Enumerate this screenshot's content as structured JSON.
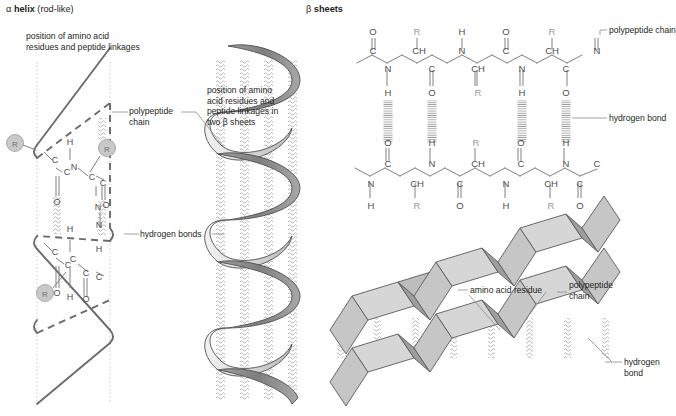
{
  "figure": {
    "kind": "protein-secondary-structure-diagram",
    "panels": [
      "alpha-helix",
      "beta-sheets"
    ]
  },
  "colors": {
    "ink": "#231f20",
    "atom_text": "#4d4d4d",
    "r_group_text": "#808080",
    "bond_line": "#808080",
    "leader": "#808080",
    "guide_dotted": "#b3b3b3",
    "ribbon_light": "#d9d9d9",
    "ribbon_mid": "#b0b0b0",
    "ribbon_dark": "#8a8a8a",
    "ribbon_edge": "#595959",
    "sheet_top": "#cfcfcf",
    "sheet_side": "#a8a8a8",
    "sheet_shadow": "#8f8f8f",
    "hbond": "#9a9a9a",
    "r_circle_fill": "#c9c9c9"
  },
  "alpha_helix": {
    "title_prefix": "α ",
    "title_bold": "helix",
    "title_suffix": " (rod-like)",
    "caption": "position of amino acid\nresidues and peptide linkages",
    "labels": {
      "polypeptide_chain": "polypeptide\nchain",
      "hydrogen_bonds": "hydrogen bonds"
    },
    "r_group_label": "R",
    "atoms": [
      "C",
      "C",
      "N",
      "H",
      "O",
      "C",
      "C",
      "N",
      "H",
      "O",
      "C",
      "C",
      "N",
      "H",
      "O"
    ]
  },
  "beta_sheets": {
    "title_prefix": "β ",
    "title_bold": "sheets",
    "title_suffix": "",
    "caption": "position of amino\nacid residues and\npeptide linkages in\ntwo β sheets",
    "labels": {
      "polypeptide_chain_top": "polypeptide chain",
      "hydrogen_bond": "hydrogen bond",
      "amino_acid_residue": "amino acid residue",
      "polypeptide_chain_bottom": "polypeptide\nchain",
      "hydrogen_bond_bottom": "hydrogen\nbond"
    },
    "upper_chain": {
      "up_atoms": [
        "O",
        "R",
        "H",
        "O",
        "R",
        "H"
      ],
      "mid_atoms": [
        "C",
        "CH",
        "N",
        "C",
        "CH",
        "N"
      ],
      "low_atoms": [
        "N",
        "C",
        "CH",
        "N",
        "C",
        "N"
      ],
      "down_atoms": [
        "H",
        "O",
        "R",
        "H",
        "O"
      ]
    },
    "lower_chain": {
      "up_atoms": [
        "O",
        "H",
        "R",
        "O",
        "H"
      ],
      "mid_atoms": [
        "C",
        "N",
        "CH",
        "C",
        "N"
      ],
      "low_atoms": [
        "N",
        "CH",
        "C",
        "N",
        "CH",
        "C"
      ],
      "down_atoms": [
        "H",
        "R",
        "O",
        "H",
        "R",
        "O"
      ]
    }
  }
}
